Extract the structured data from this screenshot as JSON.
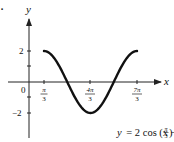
{
  "figure": {
    "marker": ".",
    "equation": {
      "lhs": "y",
      "rhs_prefix": "= 2 cos (x −",
      "frac_num": "π",
      "frac_den": "3",
      "rhs_suffix": ")"
    }
  },
  "chart_data": {
    "type": "line",
    "title": "",
    "xlabel": "x",
    "ylabel": "y",
    "function": "y = 2 cos (x - π/3)",
    "x_ticks": [
      {
        "value": 1.0472,
        "num": "π",
        "den": "3"
      },
      {
        "value": 4.1888,
        "num": "4π",
        "den": "3"
      },
      {
        "value": 7.3304,
        "num": "7π",
        "den": "3"
      }
    ],
    "y_ticks": [
      {
        "value": 2,
        "label": "2"
      },
      {
        "value": 1,
        "label": ""
      },
      {
        "value": -1,
        "label": ""
      },
      {
        "value": -2,
        "label": "-2"
      }
    ],
    "origin_label": "0",
    "x_range_plotted": [
      1.0472,
      7.3304
    ],
    "ylim": [
      -2,
      2
    ],
    "series": [
      {
        "name": "y = 2 cos (x - π/3)",
        "x": [
          1.0472,
          1.8326,
          2.618,
          3.4034,
          4.1888,
          4.9742,
          5.7596,
          6.545,
          7.3304
        ],
        "values": [
          2,
          1.414,
          0,
          -1.414,
          -2,
          -1.414,
          0,
          1.414,
          2
        ]
      }
    ],
    "grid": false,
    "legend": "none",
    "color": "#111111"
  }
}
